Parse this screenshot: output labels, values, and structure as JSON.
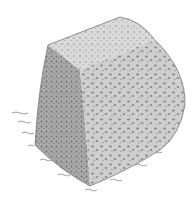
{
  "image": {
    "subject": "pencil stipple drawing of a rounded stone block on grass",
    "colors": {
      "background": "#ffffff",
      "stone_light": "#d8d8d8",
      "stone_mid": "#b9b9b9",
      "stone_dark": "#8e8e8e",
      "stipple": "#6f6f6f",
      "grass": "#8a8a8a"
    }
  }
}
